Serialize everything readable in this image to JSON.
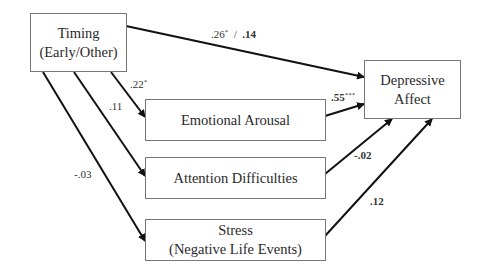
{
  "diagram": {
    "type": "path model",
    "nodes": {
      "timing": {
        "line1": "Timing",
        "line2": "(Early/Other)"
      },
      "emotional_arousal": {
        "line1": "Emotional Arousal"
      },
      "attention_difficulties": {
        "line1": "Attention Difficulties"
      },
      "stress": {
        "line1": "Stress",
        "line2": "(Negative Life Events)"
      },
      "depressive_affect": {
        "line1": "Depressive",
        "line2": "Affect"
      }
    },
    "paths": {
      "timing_to_depressive": {
        "total": ".26",
        "total_sig": "*",
        "separator": "/",
        "direct": ".14"
      },
      "timing_to_emotional": {
        "value": ".22",
        "sig": "*"
      },
      "timing_to_attention": {
        "value": ".11",
        "sig": ""
      },
      "timing_to_stress": {
        "value": "-.03",
        "sig": ""
      },
      "emotional_to_depressive": {
        "value": ".55",
        "sig": "***"
      },
      "attention_to_depressive": {
        "value": "-.02",
        "sig": ""
      },
      "stress_to_depressive": {
        "value": ".12",
        "sig": ""
      }
    }
  }
}
